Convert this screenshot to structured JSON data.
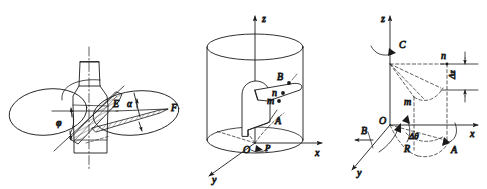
{
  "figure": {
    "background": "#ffffff",
    "stroke": "#1a1a1a",
    "panel_count": 3
  },
  "panels": [
    {
      "id": "propeller-panel",
      "name": "marine-propeller-blade-pitch-diagram",
      "labels": {
        "phi": "φ",
        "alpha": "α",
        "E": "E",
        "F": "F"
      }
    },
    {
      "id": "cylinder-panel",
      "name": "cylindrical-coordinate-blade-section-diagram",
      "labels": {
        "z": "z",
        "x": "x",
        "y": "y",
        "O": "O",
        "A": "A",
        "B": "B",
        "m": "m",
        "n": "n",
        "P": "P"
      }
    },
    {
      "id": "axes-panel",
      "name": "blade-element-angular-displacement-diagram",
      "labels": {
        "z": "z",
        "x": "x",
        "y": "y",
        "O": "O",
        "A": "A",
        "B": "B",
        "C": "C",
        "m": "m",
        "n": "n",
        "R": "R",
        "delta_z": "Δz",
        "delta_theta": "Δθ"
      }
    }
  ]
}
